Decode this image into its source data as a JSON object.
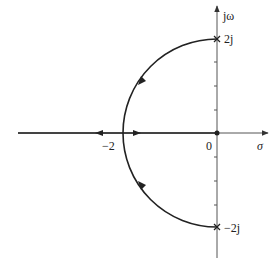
{
  "diagram": {
    "type": "root-locus",
    "axes": {
      "real_axis_label": "σ",
      "imag_axis_label": "jω"
    },
    "labels": {
      "origin": "0",
      "breakaway": "−2",
      "upper_crossing": "2j",
      "lower_crossing": "−2j"
    },
    "points": {
      "pole_origin": {
        "sigma": 0,
        "omega": 0,
        "marker": "dot"
      },
      "breakaway_point": {
        "sigma": -2,
        "omega": 0
      },
      "upper_end": {
        "sigma": 0,
        "omega": 2,
        "marker": "cross"
      },
      "lower_end": {
        "sigma": 0,
        "omega": -2,
        "marker": "cross"
      }
    },
    "branches": [
      {
        "name": "real-axis-left",
        "from": -2,
        "to": "-inf",
        "direction": "left"
      },
      {
        "name": "real-axis-right",
        "from": 0,
        "to": -2,
        "direction": "left"
      },
      {
        "name": "upper-arc",
        "from": "2j",
        "to": -2,
        "shape": "circle radius 2 centered at 0"
      },
      {
        "name": "lower-arc",
        "from": "-2j",
        "to": -2,
        "shape": "circle radius 2 centered at 0"
      }
    ],
    "colors": {
      "locus": "#222222",
      "axis": "#555555"
    }
  }
}
